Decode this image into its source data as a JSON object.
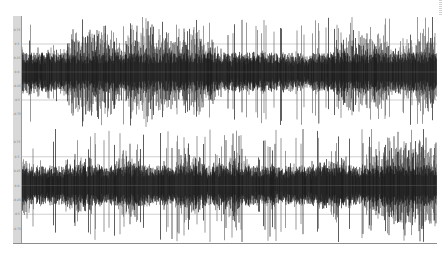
{
  "window": {
    "title": "Waveform view"
  },
  "colors": {
    "waveform": "#1a1a1a",
    "waveform_light": "#6e6e6e",
    "gridline": "#b0b0b0",
    "midline": "#505050",
    "axis_bg": "#d8d8d8"
  },
  "channels": [
    {
      "name": "Channel 1",
      "ticks": [
        "0.75",
        "0.5",
        "0.25",
        "0.0",
        "-0.25",
        "-0.5",
        "-0.75"
      ],
      "seed": 17
    },
    {
      "name": "Channel 2",
      "ticks": [
        "0.75",
        "0.5",
        "0.25",
        "0.0",
        "-0.25",
        "-0.5",
        "-0.75"
      ],
      "seed": 91
    }
  ],
  "chart_data": [
    {
      "type": "line",
      "title": "",
      "subtitle": "Channel 1 audio waveform",
      "xlabel": "",
      "ylabel": "Amplitude",
      "ylim": [
        -1,
        1
      ],
      "yticks": [
        0.75,
        0.5,
        0.25,
        0.0,
        -0.25,
        -0.5,
        -0.75
      ],
      "grid": true,
      "legend": "none",
      "description": "Dense noise-like waveform; near full-scale peaks across entire duration, bursty envelope"
    },
    {
      "type": "line",
      "title": "",
      "subtitle": "Channel 2 audio waveform",
      "xlabel": "",
      "ylabel": "Amplitude",
      "ylim": [
        -1,
        1
      ],
      "yticks": [
        0.75,
        0.5,
        0.25,
        0.0,
        -0.25,
        -0.5,
        -0.75
      ],
      "grid": true,
      "legend": "none",
      "description": "Dense noise-like waveform; slightly lower average envelope than channel 1 with peak bursts"
    }
  ]
}
